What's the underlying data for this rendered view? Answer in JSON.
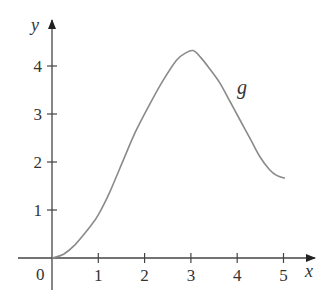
{
  "chart_data": {
    "type": "line",
    "title": "",
    "xlabel": "x",
    "ylabel": "y",
    "origin_label": "0",
    "curve_label": "g",
    "xlim": [
      0,
      5.6
    ],
    "ylim": [
      0,
      4.9
    ],
    "x_ticks": [
      1,
      2,
      3,
      4,
      5
    ],
    "y_ticks": [
      1,
      2,
      3,
      4
    ],
    "grid": false,
    "legend": "none",
    "series": [
      {
        "name": "g",
        "x": [
          0,
          0.25,
          0.5,
          0.82,
          1.0,
          1.25,
          1.54,
          1.8,
          2.12,
          2.4,
          2.69,
          2.9,
          3.05,
          3.2,
          3.4,
          3.63,
          3.85,
          4.06,
          4.3,
          4.49,
          4.7,
          4.85,
          5.03
        ],
        "y": [
          0,
          0.08,
          0.28,
          0.65,
          0.9,
          1.38,
          2.04,
          2.62,
          3.22,
          3.7,
          4.12,
          4.28,
          4.32,
          4.19,
          3.95,
          3.64,
          3.25,
          2.875,
          2.45,
          2.11,
          1.84,
          1.72,
          1.66
        ]
      }
    ],
    "annotations": [
      {
        "text": "g",
        "x": 4.1,
        "y": 3.6
      }
    ],
    "colors": {
      "axis": "#333333",
      "curve": "#8a8a8a"
    }
  }
}
